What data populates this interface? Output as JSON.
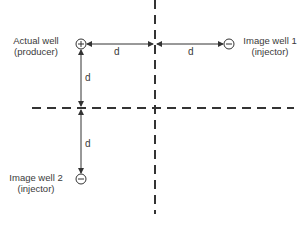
{
  "diagram": {
    "type": "method-of-images",
    "colors": {
      "line": "#333333",
      "text": "#3a3a3a",
      "background": "#ffffff"
    },
    "wells": [
      {
        "id": "actual",
        "line1": "Actual well",
        "line2": "(producer)",
        "symbol": "+",
        "icon": "plus-circle-icon"
      },
      {
        "id": "image1",
        "line1": "Image well 1",
        "line2": "(injector)",
        "symbol": "−",
        "icon": "minus-circle-icon"
      },
      {
        "id": "image2",
        "line1": "Image well 2",
        "line2": "(injector)",
        "symbol": "−",
        "icon": "minus-circle-icon"
      }
    ],
    "distances": {
      "actual_to_vertical_boundary": "d",
      "vertical_boundary_to_image1": "d",
      "actual_to_horizontal_boundary": "d",
      "horizontal_boundary_to_image2": "d"
    },
    "boundaries": [
      "vertical dashed line",
      "horizontal dashed line"
    ]
  }
}
